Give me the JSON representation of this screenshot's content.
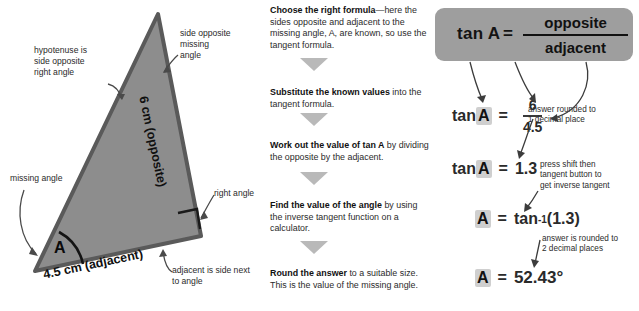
{
  "figure": {
    "annotations": {
      "hypotenuse": "hypotenuse is\nside opposite\nright angle",
      "side_opposite": "side opposite\nmissing\nangle",
      "missing_angle": "missing angle",
      "right_angle": "right angle",
      "adjacent_note": "adjacent is side next\nto angle"
    },
    "labels": {
      "opposite_side": "6 cm (opposite)",
      "adjacent_side": "4.5 cm (adjacent)",
      "angle": "A"
    },
    "colors": {
      "triangle_fill": "#8d8d8d",
      "triangle_stroke": "#555555"
    }
  },
  "steps": [
    {
      "bold": "Choose the right formula",
      "rest": "—here the sides opposite and adjacent to the missing angle, A, are known, so use the tangent formula."
    },
    {
      "bold": "Substitute the known values",
      "rest": " into the tangent formula."
    },
    {
      "bold": "Work out the value of tan A",
      "rest": " by dividing the opposite by the adjacent."
    },
    {
      "bold": "Find the value of the angle",
      "rest": " by using the inverse tangent function on a calculator."
    },
    {
      "bold": "Round the answer",
      "rest": " to a suitable size. This is the value of the missing angle."
    }
  ],
  "working": {
    "formula_box": {
      "lhs": "tan A",
      "equals": "=",
      "numerator": "opposite",
      "denominator": "adjacent",
      "background": "#9e9e9e"
    },
    "substitute": {
      "lhs_pre": "tan ",
      "lhs_var": "A",
      "equals": "=",
      "numerator": "6",
      "denominator": "4.5"
    },
    "value": {
      "lhs_pre": "tan ",
      "lhs_var": "A",
      "equals": "=",
      "result": "1.3"
    },
    "inverse": {
      "lhs_var": "A",
      "equals": "=",
      "fn": "tan",
      "exponent": "-1",
      "arg": " (1.3)"
    },
    "answer": {
      "lhs_var": "A",
      "equals": "=",
      "result": "52.43°"
    },
    "notes": {
      "one_dp": "answer rounded to\n1 decimal place",
      "shift": "press shift then\ntangent button to\nget inverse tangent",
      "two_dp": "answer is rounded to\n2 decimal places"
    }
  }
}
